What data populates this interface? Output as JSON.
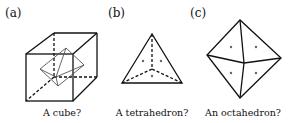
{
  "panels": [
    {
      "id": "a",
      "label": "(a)",
      "caption": "A cube?"
    },
    {
      "id": "b",
      "label": "(b)",
      "caption": "A tetrahedron?"
    },
    {
      "id": "c",
      "label": "(c)",
      "caption": "An octahedron?"
    }
  ],
  "colors": {
    "stroke": "#111111",
    "inner_stroke": "#555555",
    "dot": "#666666"
  }
}
